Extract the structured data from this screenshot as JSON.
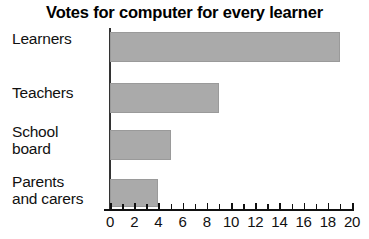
{
  "chart_data": {
    "type": "bar",
    "orientation": "horizontal",
    "title": "Votes for computer for every learner",
    "xlabel": "",
    "ylabel": "",
    "categories": [
      "Learners",
      "Teachers",
      "School board",
      "Parents and carers"
    ],
    "category_lines": [
      [
        "Learners"
      ],
      [
        "Teachers"
      ],
      [
        "School",
        "board"
      ],
      [
        "Parents",
        "and carers"
      ]
    ],
    "values": [
      19,
      9,
      5,
      4
    ],
    "xlim": [
      0,
      20
    ],
    "xticks": [
      0,
      2,
      4,
      6,
      8,
      10,
      12,
      14,
      16,
      18,
      20
    ],
    "xtick_labels": [
      "0",
      "2",
      "4",
      "6",
      "8",
      "10",
      "12",
      "14",
      "16",
      "18",
      "20"
    ],
    "minor_tick_step": 1,
    "grid": false,
    "legend": null,
    "bar_color": "#aaaaaa",
    "bar_edge_color": "#9a9a9a",
    "axis_color": "#111111",
    "text_color": "#111111",
    "background_color": "#ffffff"
  }
}
